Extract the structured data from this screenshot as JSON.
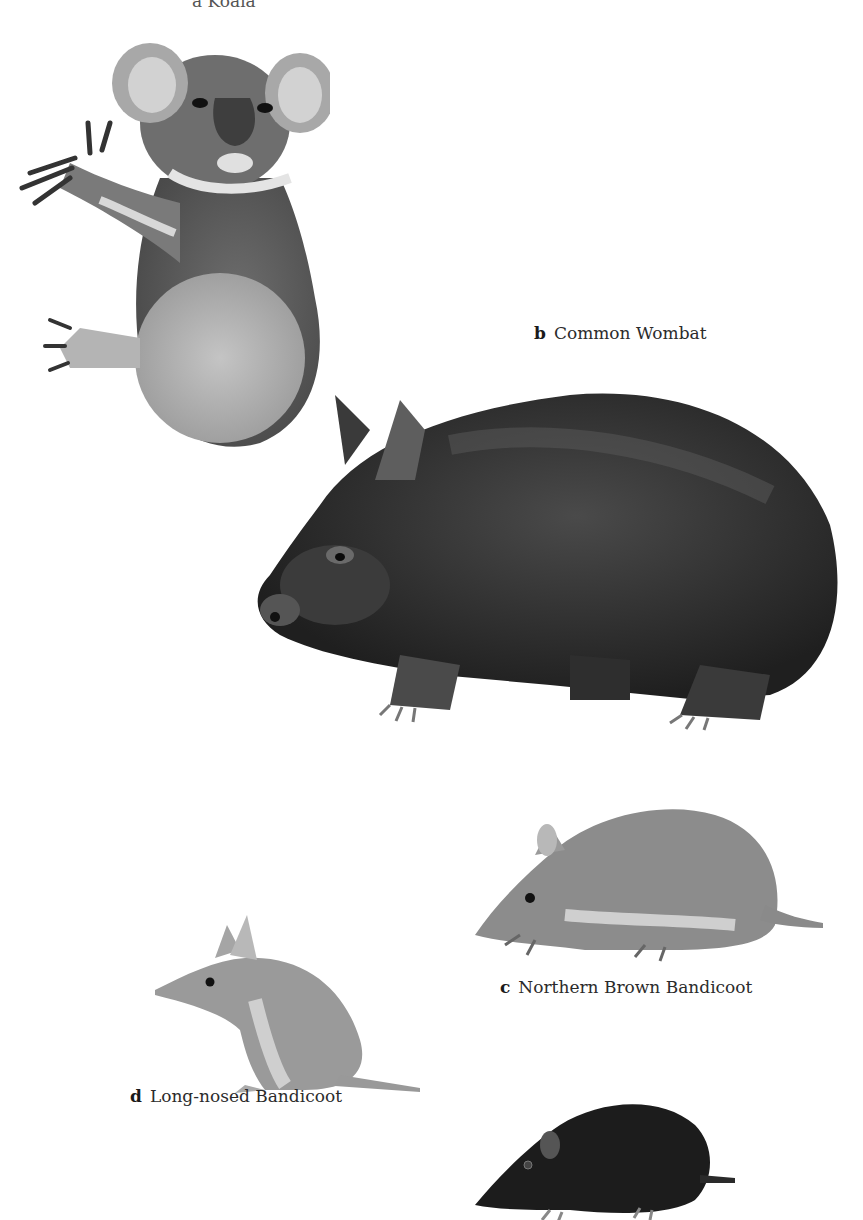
{
  "plate": {
    "background": "#ffffff",
    "labels": [
      {
        "id": "a",
        "letter": "a",
        "name": "Koala",
        "partially_visible": true
      },
      {
        "id": "b",
        "letter": "b",
        "name": "Common Wombat"
      },
      {
        "id": "c",
        "letter": "c",
        "name": "Northern Brown Bandicoot"
      },
      {
        "id": "d",
        "letter": "d",
        "name": "Long-nosed Bandicoot"
      }
    ],
    "animals": [
      {
        "name": "koala",
        "tone": "#8a8a8a"
      },
      {
        "name": "common-wombat",
        "tone": "#2a2a2a"
      },
      {
        "name": "northern-brown-bandicoot",
        "tone": "#8c8c8c"
      },
      {
        "name": "long-nosed-bandicoot",
        "tone": "#9a9a9a"
      },
      {
        "name": "dark-bandicoot",
        "tone": "#1c1c1c"
      }
    ]
  }
}
